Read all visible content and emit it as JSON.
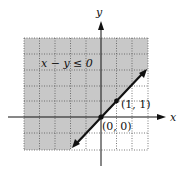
{
  "figure": {
    "inequality_label": "x − y ≤ 0",
    "x_axis_label": "x",
    "y_axis_label": "y",
    "points": [
      {
        "label": "(0, 0)",
        "x": 0,
        "y": 0
      },
      {
        "label": "(1, 1)",
        "x": 1,
        "y": 1
      }
    ],
    "boundary_line": "y = x",
    "grid": {
      "x_min": -5,
      "x_max": 3,
      "y_min": -2,
      "y_max": 5
    },
    "colors": {
      "shade": "#c8c8c8",
      "line": "#111111",
      "grid": "#555555"
    }
  }
}
